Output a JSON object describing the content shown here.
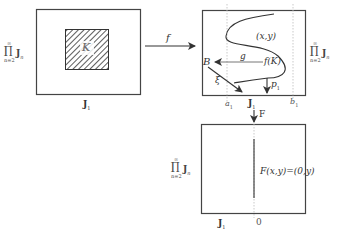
{
  "diagram": {
    "left_box": {
      "region_label": "K",
      "x_axis_label": "J",
      "x_axis_subscript": "1",
      "y_axis_label": {
        "operator": "∏",
        "upper": "∞",
        "lower": "n=2",
        "factor": "J",
        "factor_subscript": "n"
      }
    },
    "arrow_f": {
      "label": "f"
    },
    "top_right_box": {
      "curve_label": "(x,y)",
      "image_label": "f(K)",
      "arrow_g_label": "g",
      "point_B_label": "B",
      "arrow_xi_label": "ξ",
      "arrow_p1_label": "p",
      "arrow_p1_subscript": "1",
      "tick_a": "a",
      "tick_a_subscript": "1",
      "tick_b": "b",
      "tick_b_subscript": "1",
      "x_axis_label": "J",
      "x_axis_subscript": "1",
      "y_axis_label": {
        "operator": "∏",
        "upper": "∞",
        "lower": "n=2",
        "factor": "J",
        "factor_subscript": "n"
      }
    },
    "arrow_F": {
      "label": "F"
    },
    "bottom_right_box": {
      "formula_label": "F(x,y)=(0,y)",
      "x_axis_label": "J",
      "x_axis_subscript": "1",
      "zero_tick": "0",
      "y_axis_label": {
        "operator": "∏",
        "upper": "∞",
        "lower": "n=2",
        "factor": "J",
        "factor_subscript": "n"
      }
    },
    "colors": {
      "stroke": "#444444",
      "dashed": "#bbbbbb",
      "text": "#333333"
    }
  }
}
